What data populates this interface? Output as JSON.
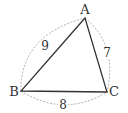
{
  "diagram": {
    "type": "triangle",
    "vertices": [
      {
        "name": "A",
        "x": 85,
        "y": 18,
        "label_x": 85,
        "label_y": 14
      },
      {
        "name": "B",
        "x": 21,
        "y": 91,
        "label_x": 14,
        "label_y": 96
      },
      {
        "name": "C",
        "x": 107,
        "y": 92,
        "label_x": 114,
        "label_y": 96
      }
    ],
    "sides": [
      {
        "from": "A",
        "to": "B",
        "length": "9",
        "label_x": 45,
        "label_y": 50
      },
      {
        "from": "A",
        "to": "C",
        "length": "7",
        "label_x": 107,
        "label_y": 57
      },
      {
        "from": "B",
        "to": "C",
        "length": "8",
        "label_x": 63,
        "label_y": 109
      }
    ],
    "colors": {
      "edge": "#333333",
      "dashed_arc": "#999999",
      "text": "#333333"
    }
  }
}
